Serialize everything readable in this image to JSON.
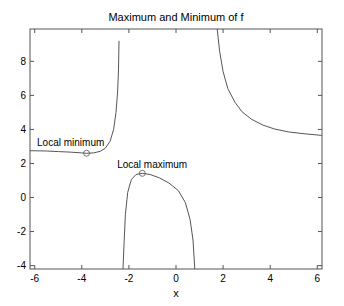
{
  "chart_data": {
    "type": "line",
    "title": "Maximum and Minimum of f",
    "xlabel": "x",
    "ylabel": "",
    "xlim": [
      -6.2,
      6.2
    ],
    "ylim": [
      -4.2,
      9.9
    ],
    "xticks": [
      -6,
      -4,
      -2,
      0,
      2,
      4,
      6
    ],
    "yticks": [
      -4,
      -2,
      0,
      2,
      4,
      6,
      8
    ],
    "grid": false,
    "legend": null,
    "line_color": "#555555",
    "series": [
      {
        "name": "f branch 1 (left)",
        "points": [
          [
            -6.2,
            2.75
          ],
          [
            -5.5,
            2.73
          ],
          [
            -5.0,
            2.7
          ],
          [
            -4.5,
            2.67
          ],
          [
            -4.0,
            2.62
          ],
          [
            -3.8,
            2.6
          ],
          [
            -3.5,
            2.62
          ],
          [
            -3.2,
            2.72
          ],
          [
            -3.0,
            2.9
          ],
          [
            -2.8,
            3.3
          ],
          [
            -2.65,
            4.0
          ],
          [
            -2.55,
            5.0
          ],
          [
            -2.48,
            6.2
          ],
          [
            -2.44,
            7.5
          ],
          [
            -2.42,
            9.2
          ]
        ]
      },
      {
        "name": "f branch 2 (middle)",
        "points": [
          [
            -2.25,
            -4.2
          ],
          [
            -2.2,
            -2.5
          ],
          [
            -2.15,
            -1.0
          ],
          [
            -2.05,
            0.3
          ],
          [
            -1.9,
            1.05
          ],
          [
            -1.7,
            1.35
          ],
          [
            -1.43,
            1.42
          ],
          [
            -1.1,
            1.35
          ],
          [
            -0.7,
            1.15
          ],
          [
            -0.3,
            0.85
          ],
          [
            0.1,
            0.4
          ],
          [
            0.4,
            -0.3
          ],
          [
            0.6,
            -1.3
          ],
          [
            0.72,
            -2.5
          ],
          [
            0.8,
            -4.2
          ]
        ]
      },
      {
        "name": "f branch 3 (right)",
        "points": [
          [
            1.75,
            9.9
          ],
          [
            1.85,
            8.6
          ],
          [
            2.0,
            7.4
          ],
          [
            2.2,
            6.4
          ],
          [
            2.5,
            5.6
          ],
          [
            2.8,
            5.05
          ],
          [
            3.2,
            4.6
          ],
          [
            3.7,
            4.25
          ],
          [
            4.2,
            4.02
          ],
          [
            4.8,
            3.85
          ],
          [
            5.5,
            3.74
          ],
          [
            6.2,
            3.65
          ]
        ]
      }
    ],
    "markers": [
      {
        "name": "local minimum",
        "x": -3.8,
        "y": 2.6
      },
      {
        "name": "local maximum",
        "x": -1.43,
        "y": 1.42
      }
    ],
    "annotations": [
      {
        "text": "Local minimum",
        "x": -5.9,
        "y": 3.05
      },
      {
        "text": "Local maximum",
        "x": -2.5,
        "y": 1.75
      }
    ]
  }
}
